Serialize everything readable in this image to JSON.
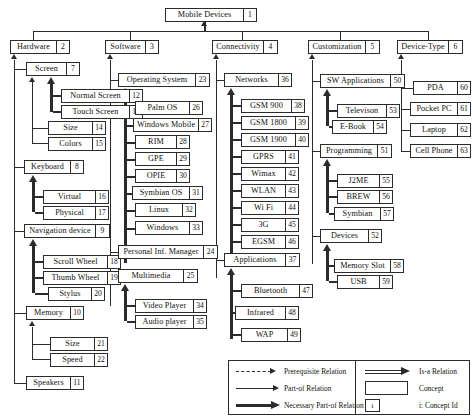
{
  "root": {
    "label": "Mobile Devices",
    "id": "1"
  },
  "columns": [
    {
      "name": "hardware",
      "root": {
        "label": "Hardware",
        "id": "2"
      },
      "children": [
        {
          "label": "Screen",
          "id": "7",
          "children": [
            {
              "label": "Normal Screen",
              "id": "12"
            },
            {
              "label": "Touch Screen",
              "id": "13"
            },
            {
              "label": "Size",
              "id": "14"
            },
            {
              "label": "Colors",
              "id": "15"
            }
          ]
        },
        {
          "label": "Keyboard",
          "id": "8",
          "children": [
            {
              "label": "Virtual",
              "id": "16"
            },
            {
              "label": "Physical",
              "id": "17"
            }
          ]
        },
        {
          "label": "Navigation device",
          "id": "9",
          "children": [
            {
              "label": "Scroll Wheel",
              "id": "18"
            },
            {
              "label": "Thumb Wheel",
              "id": "19"
            },
            {
              "label": "Stylus",
              "id": "20"
            }
          ]
        },
        {
          "label": "Memory",
          "id": "10",
          "children": [
            {
              "label": "Size",
              "id": "21"
            },
            {
              "label": "Speed",
              "id": "22"
            }
          ]
        },
        {
          "label": "Speakers",
          "id": "11",
          "children": []
        }
      ]
    },
    {
      "name": "software",
      "root": {
        "label": "Software",
        "id": "3"
      },
      "children": [
        {
          "label": "Operating System",
          "id": "23",
          "children": [
            {
              "label": "Palm OS",
              "id": "26"
            },
            {
              "label": "Windows Mobile",
              "id": "27"
            },
            {
              "label": "RIM",
              "id": "28"
            },
            {
              "label": "GPE",
              "id": "29"
            },
            {
              "label": "OPIE",
              "id": "30"
            },
            {
              "label": "Symbian OS",
              "id": "31"
            },
            {
              "label": "Linux",
              "id": "32"
            },
            {
              "label": "Windows",
              "id": "33"
            }
          ]
        },
        {
          "label": "Personal Inf. Manager",
          "id": "24",
          "children": []
        },
        {
          "label": "Multimedia",
          "id": "25",
          "children": [
            {
              "label": "Video Player",
              "id": "34"
            },
            {
              "label": "Audio player",
              "id": "35"
            }
          ]
        }
      ]
    },
    {
      "name": "connectivity",
      "root": {
        "label": "Connectivity",
        "id": "4"
      },
      "children": [
        {
          "label": "Networks",
          "id": "36",
          "children": [
            {
              "label": "GSM 900",
              "id": "38"
            },
            {
              "label": "GSM 1800",
              "id": "39"
            },
            {
              "label": "GSM 1900",
              "id": "40"
            },
            {
              "label": "GPRS",
              "id": "41"
            },
            {
              "label": "Wimax",
              "id": "42"
            },
            {
              "label": "WLAN",
              "id": "43"
            },
            {
              "label": "Wi Fi",
              "id": "44"
            },
            {
              "label": "3G",
              "id": "45"
            },
            {
              "label": "EGSM",
              "id": "46"
            }
          ]
        },
        {
          "label": "Applications",
          "id": "37",
          "children": [
            {
              "label": "Bluetooth",
              "id": "47"
            },
            {
              "label": "Infrared",
              "id": "48"
            },
            {
              "label": "WAP",
              "id": "49"
            }
          ]
        }
      ]
    },
    {
      "name": "customization",
      "root": {
        "label": "Customization",
        "id": "5"
      },
      "children": [
        {
          "label": "SW Applications",
          "id": "50",
          "children": [
            {
              "label": "Televison",
              "id": "53"
            },
            {
              "label": "E-Book",
              "id": "54"
            }
          ]
        },
        {
          "label": "Programming",
          "id": "51",
          "children": [
            {
              "label": "J2ME",
              "id": "55"
            },
            {
              "label": "BREW",
              "id": "56"
            },
            {
              "label": "Symbian",
              "id": "57"
            }
          ]
        },
        {
          "label": "Devices",
          "id": "52",
          "children": [
            {
              "label": "Memory Slot",
              "id": "58"
            },
            {
              "label": "USB",
              "id": "59"
            }
          ]
        }
      ]
    },
    {
      "name": "device-type",
      "root": {
        "label": "Device-Type",
        "id": "6"
      },
      "children": [
        {
          "label": "PDA",
          "id": "60"
        },
        {
          "label": "Pocket PC",
          "id": "61"
        },
        {
          "label": "Laptop",
          "id": "62"
        },
        {
          "label": "Cell Phone",
          "id": "63"
        }
      ]
    }
  ],
  "legend": {
    "left": [
      {
        "key": "prerequisite",
        "label": "Prerequisite Relation",
        "style": "dashed-arrow"
      },
      {
        "key": "part-of",
        "label": "Part-of Relation",
        "style": "thin-arrow"
      },
      {
        "key": "necessary-part-of",
        "label": "Necessary Part-of Relation",
        "style": "thick-arrow"
      }
    ],
    "right": [
      {
        "key": "is-a",
        "label": "Is-a Relation",
        "style": "double-arrow"
      },
      {
        "key": "concept",
        "label": "Concept",
        "style": "box"
      },
      {
        "key": "concept-id",
        "label": "i: Concept Id",
        "style": "id-box",
        "sample": "i"
      }
    ]
  },
  "colors": {
    "ink": "#2b2b2b",
    "paper": "#ffffff"
  }
}
